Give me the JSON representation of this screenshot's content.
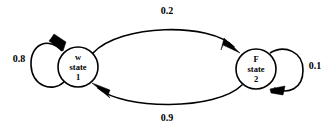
{
  "diagram": {
    "type": "state-transition-diagram",
    "background_color": "#ffffff",
    "stroke_color": "#000000",
    "nodes": [
      {
        "id": "state1",
        "symbol": "w",
        "word": "state",
        "number": "1",
        "cx": 78,
        "cy": 67,
        "r": 20
      },
      {
        "id": "state2",
        "symbol": "F",
        "word": "state",
        "number": "2",
        "cx": 256,
        "cy": 69,
        "r": 20
      }
    ],
    "edges": [
      {
        "id": "e-1-to-2",
        "from": "state1",
        "to": "state2",
        "weight": "0.2",
        "label_x": 167,
        "label_y": 12,
        "position": "top"
      },
      {
        "id": "e-2-to-1",
        "from": "state2",
        "to": "state1",
        "weight": "0.9",
        "label_x": 167,
        "label_y": 119,
        "position": "bottom"
      },
      {
        "id": "e-1-self",
        "from": "state1",
        "to": "state1",
        "weight": "0.8",
        "label_x": 19,
        "label_y": 60,
        "position": "left-self-loop"
      },
      {
        "id": "e-2-self",
        "from": "state2",
        "to": "state2",
        "weight": "0.1",
        "label_x": 315,
        "label_y": 67,
        "position": "right-self-loop"
      }
    ]
  }
}
